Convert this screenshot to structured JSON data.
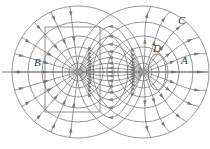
{
  "figure": {
    "name": "electric-dipole-field-diagram",
    "width": 210,
    "height": 149,
    "background": "#ffffff",
    "line_color": "#6b6b6b",
    "label_color": "#3a3a3a",
    "axis_color": "#5f5f5f"
  },
  "labels": [
    {
      "id": "A",
      "text": "A",
      "x": 181,
      "y": 64
    },
    {
      "id": "B",
      "text": "B",
      "x": 34,
      "y": 66
    },
    {
      "id": "C",
      "text": "C",
      "x": 178,
      "y": 24
    },
    {
      "id": "D",
      "text": "D",
      "x": 153,
      "y": 52
    }
  ],
  "charges": [
    {
      "id": "negative-charge",
      "sign": "-",
      "x": 78,
      "y": 72,
      "r": 3.2
    },
    {
      "id": "positive-charge",
      "sign": "+",
      "x": 143,
      "y": 72,
      "r": 3.2
    }
  ],
  "axis": {
    "y": 72,
    "x1": 2,
    "x2": 208
  },
  "gaussian_rectangle": {
    "x": 45,
    "y": 27,
    "width": 55,
    "height": 85
  },
  "small_loop": {
    "cx": 157,
    "cy": 72,
    "rx": 9,
    "ry": 18
  },
  "chart_data": {
    "type": "diagram",
    "elements": [
      "field-lines",
      "equipotential-circles",
      "arrowheads",
      "horizontal-axis",
      "gaussian-rectangle",
      "small-loop",
      "charge-dots"
    ],
    "labeled_regions": [
      "A",
      "B",
      "C",
      "D"
    ],
    "field_line_count": 26,
    "equipotential_circle_count": 12,
    "xlabel": "",
    "ylabel": "",
    "grid": false,
    "legend": false
  }
}
